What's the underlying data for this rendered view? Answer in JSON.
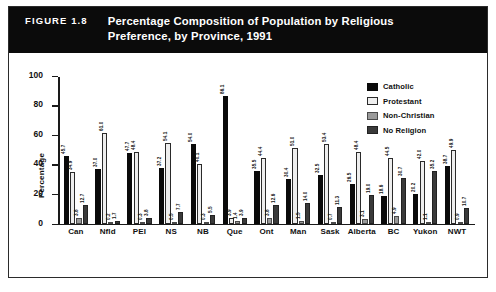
{
  "figure": {
    "number_label": "FIGURE 1.8",
    "title_line1": "Percentage Composition of Population by Religious",
    "title_line2": "Preference, by Province, 1991"
  },
  "legend": {
    "items": [
      {
        "label": "Catholic",
        "color": "#0a0a0a",
        "swatch": "catholic-swatch"
      },
      {
        "label": "Protestant",
        "color": "#eeeeee",
        "swatch": "protestant-swatch"
      },
      {
        "label": "Non-Christian",
        "color": "#9a9a9a",
        "swatch": "non-christian-swatch"
      },
      {
        "label": "No Religion",
        "color": "#3a3a3a",
        "swatch": "no-religion-swatch"
      }
    ]
  },
  "axis": {
    "y_title": "Percentage",
    "y_ticks": [
      "0",
      "20",
      "40",
      "60",
      "80",
      "100"
    ]
  },
  "chart_data": {
    "type": "bar",
    "title": "Percentage Composition of Population by Religious Preference, by Province, 1991",
    "xlabel": "",
    "ylabel": "Percentage",
    "ylim": [
      0,
      100
    ],
    "ytick_step": 20,
    "grid": false,
    "legend_position": "top-right",
    "categories": [
      "Can",
      "Nfld",
      "PEI",
      "NS",
      "NB",
      "Que",
      "Ont",
      "Man",
      "Sask",
      "Alberta",
      "BC",
      "Yukon",
      "NWT"
    ],
    "series": [
      {
        "name": "Catholic",
        "color": "#0a0a0a",
        "values": [
          45.7,
          37.0,
          47.7,
          37.2,
          54.0,
          86.1,
          35.5,
          30.4,
          32.5,
          26.5,
          18.6,
          20.2,
          38.7
        ]
      },
      {
        "name": "Protestant",
        "color": "#eeeeee",
        "values": [
          34.9,
          61.0,
          48.4,
          54.1,
          40.1,
          3.9,
          44.4,
          51.0,
          53.4,
          48.4,
          44.5,
          42.0,
          49.9
        ]
      },
      {
        "name": "Non-Christian",
        "color": "#9a9a9a",
        "values": [
          3.8,
          0.2,
          0.3,
          0.5,
          0.3,
          1.4,
          3.8,
          1.5,
          0.7,
          3.1,
          4.9,
          1.1,
          0.9
        ]
      },
      {
        "name": "No Religion",
        "color": "#3a3a3a",
        "values": [
          12.7,
          1.7,
          3.8,
          7.7,
          5.5,
          3.9,
          12.6,
          14.0,
          11.3,
          19.0,
          30.7,
          35.2,
          10.7
        ]
      }
    ],
    "bar_labels": [
      [
        "45.7",
        "34.9",
        "3.8",
        "12.7"
      ],
      [
        "37.0",
        "61.0",
        "0.2",
        "1.7"
      ],
      [
        "47.7",
        "48.4",
        "0.3",
        "3.8"
      ],
      [
        "37.2",
        "54.1",
        "0.5",
        "7.7"
      ],
      [
        "54.0",
        "40.1",
        "0.3",
        "5.5"
      ],
      [
        "86.1",
        "3.9",
        "1.4",
        "3.9"
      ],
      [
        "35.5",
        "44.4",
        "3.8",
        "12.6"
      ],
      [
        "30.4",
        "51.0",
        "1.5",
        "14.0"
      ],
      [
        "32.5",
        "53.4",
        "0.7",
        "11.3"
      ],
      [
        "26.5",
        "48.4",
        "3.1",
        "19.0"
      ],
      [
        "18.6",
        "44.5",
        "4.9",
        "30.7"
      ],
      [
        "20.2",
        "42.0",
        "1.1",
        "35.2"
      ],
      [
        "38.7",
        "49.9",
        "0.9",
        "10.7"
      ]
    ]
  }
}
